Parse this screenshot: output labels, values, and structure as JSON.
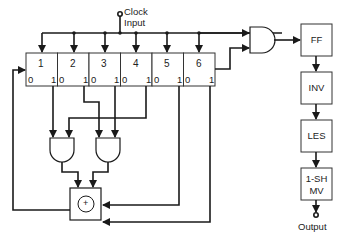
{
  "diagram": {
    "clock_label_line1": "Clock",
    "clock_label_line2": "Input",
    "output_label": "Output",
    "register": {
      "cells": [
        {
          "number": "1",
          "out0": "0",
          "out1": "1"
        },
        {
          "number": "2",
          "out0": "0",
          "out1": "1"
        },
        {
          "number": "3",
          "out0": "0",
          "out1": "1"
        },
        {
          "number": "4",
          "out0": "0",
          "out1": "1"
        },
        {
          "number": "5",
          "out0": "0",
          "out1": "1"
        },
        {
          "number": "6",
          "out0": "0",
          "out1": "1"
        }
      ]
    },
    "xor_symbol": "+",
    "pipeline": [
      {
        "label": "FF"
      },
      {
        "label": "INV"
      },
      {
        "label": "LES"
      },
      {
        "label_line1": "1-SH",
        "label_line2": "MV"
      }
    ],
    "colors": {
      "line": "#1a1a1a",
      "box_border": "#333333",
      "background": "#ffffff"
    }
  }
}
